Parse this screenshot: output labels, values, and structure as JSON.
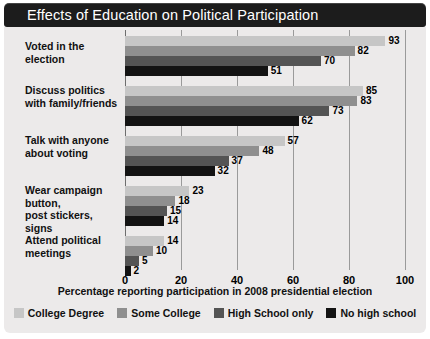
{
  "header": {
    "title": "Effects of Education on Political Participation"
  },
  "chart_data": {
    "type": "bar",
    "orientation": "horizontal",
    "title": "Effects of Education on Political Participation",
    "xlabel": "Percentage reporting participation in 2008 presidential election",
    "ylabel": "",
    "xlim": [
      0,
      100
    ],
    "xticks": [
      0,
      20,
      40,
      60,
      80,
      100
    ],
    "grid": true,
    "legend_position": "bottom",
    "categories": [
      "Voted in the election",
      "Discuss politics with family/friends",
      "Talk with anyone about voting",
      "Wear campaign button, post stickers, signs",
      "Attend political meetings"
    ],
    "category_lines": [
      [
        "Voted in the election"
      ],
      [
        "Discuss politics",
        "with family/friends"
      ],
      [
        "Talk with anyone",
        "about voting"
      ],
      [
        "Wear campaign button,",
        "post stickers, signs"
      ],
      [
        "Attend political",
        "meetings"
      ]
    ],
    "series": [
      {
        "name": "College Degree",
        "color": "#c6c6c6",
        "values": [
          93,
          85,
          57,
          23,
          14
        ]
      },
      {
        "name": "Some College",
        "color": "#8f8f8f",
        "values": [
          82,
          83,
          48,
          18,
          10
        ]
      },
      {
        "name": "High School only",
        "color": "#545454",
        "values": [
          70,
          73,
          37,
          15,
          5
        ]
      },
      {
        "name": "No high school",
        "color": "#131313",
        "values": [
          51,
          62,
          32,
          14,
          2
        ]
      }
    ]
  },
  "legend": {
    "items": [
      {
        "label": "College Degree",
        "color": "#c6c6c6"
      },
      {
        "label": "Some College",
        "color": "#8f8f8f"
      },
      {
        "label": "High School only",
        "color": "#545454"
      },
      {
        "label": "No high school",
        "color": "#131313"
      }
    ]
  },
  "axis": {
    "title": "Percentage reporting participation in 2008 presidential election",
    "ticks": [
      "0",
      "20",
      "40",
      "60",
      "80",
      "100"
    ]
  }
}
